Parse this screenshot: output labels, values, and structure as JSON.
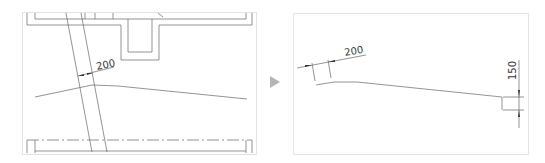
{
  "before": {
    "dimension_label": "200"
  },
  "transition": {
    "icon": "play-arrow-icon",
    "color": "#b5b5b5"
  },
  "after": {
    "width_dimension_label": "200",
    "height_dimension_label": "150"
  },
  "colors": {
    "line": "#555555",
    "frame": "#e4e4e4",
    "arrow": "#b5b5b5"
  }
}
